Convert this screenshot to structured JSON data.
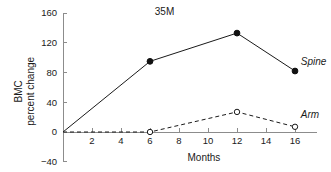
{
  "chart_data": {
    "type": "line",
    "title": "35M",
    "xlabel": "Months",
    "ylabel_lines": [
      "BMC",
      "percent change"
    ],
    "ylabel": "BMC percent change",
    "xlim": [
      0,
      17.5
    ],
    "ylim": [
      -40,
      160
    ],
    "xticks": [
      2,
      4,
      6,
      8,
      10,
      12,
      14,
      16
    ],
    "xtick_labels": [
      "2",
      "4",
      "6",
      "8",
      "10",
      "12",
      "14",
      "16"
    ],
    "yticks": [
      -40,
      0,
      40,
      80,
      120,
      160
    ],
    "ytick_labels": [
      "−40",
      "0",
      "40",
      "80",
      "120",
      "160"
    ],
    "grid": false,
    "legend_position": "inline-right",
    "series": [
      {
        "name": "Spine",
        "label": "Spine",
        "line_style": "solid",
        "marker": "filled-circle",
        "color": "#1a1a1a",
        "x": [
          0,
          6,
          12,
          16
        ],
        "values": [
          0,
          95,
          133,
          82
        ],
        "label_x": 16.4,
        "label_y": 95
      },
      {
        "name": "Arm",
        "label": "Arm",
        "line_style": "dashed",
        "marker": "open-circle",
        "color": "#1a1a1a",
        "x": [
          0,
          6,
          12,
          16
        ],
        "values": [
          0,
          0,
          27,
          7
        ],
        "label_x": 16.4,
        "label_y": 24
      }
    ],
    "title_x": 7,
    "title_y": 158
  }
}
